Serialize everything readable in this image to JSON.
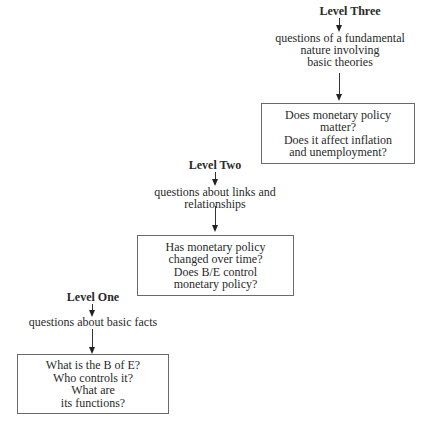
{
  "diagram": {
    "type": "hierarchy-staircase",
    "levels": [
      {
        "id": "level-three",
        "title": "Level Three",
        "description": "questions of a fundamental\nnature involving\nbasic theories",
        "box_text": "Does monetary policy\nmatter?\nDoes it affect inflation\nand unemployment?"
      },
      {
        "id": "level-two",
        "title": "Level Two",
        "description": "questions about links and\nrelationships",
        "box_text": "Has monetary policy\nchanged over time?\nDoes B/E control\nmonetary policy?"
      },
      {
        "id": "level-one",
        "title": "Level One",
        "description": "questions about basic facts",
        "box_text": "What is the B of E?\nWho controls it?\nWhat are\nits functions?"
      }
    ],
    "colors": {
      "text": "#2a2a2a",
      "box_border": "#6a6a6a",
      "arrow": "#222222",
      "background": "#ffffff"
    }
  }
}
